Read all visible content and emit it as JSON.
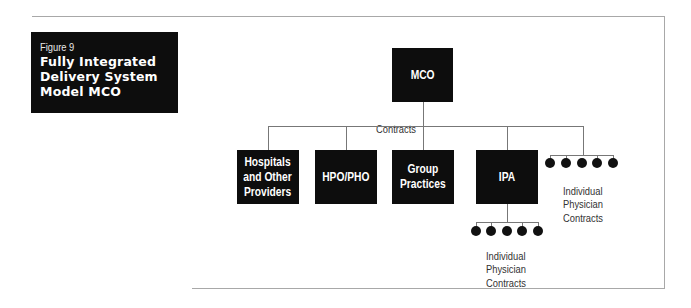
{
  "figure": {
    "number": "Figure 9",
    "title": "Fully Integrated\nDelivery System\nModel MCO"
  },
  "diagram": {
    "root": {
      "label": "MCO"
    },
    "connector_label": "Contracts",
    "children": [
      {
        "label": "Hospitals\nand Other\nProviders"
      },
      {
        "label": "HPO/PHO"
      },
      {
        "label": "Group\nPractices"
      },
      {
        "label": "IPA"
      }
    ],
    "direct_contracts": {
      "label": "Individual\nPhysician\nContracts",
      "count": 5
    },
    "ipa_contracts": {
      "label": "Individual\nPhysician\nContracts",
      "count": 5
    }
  }
}
